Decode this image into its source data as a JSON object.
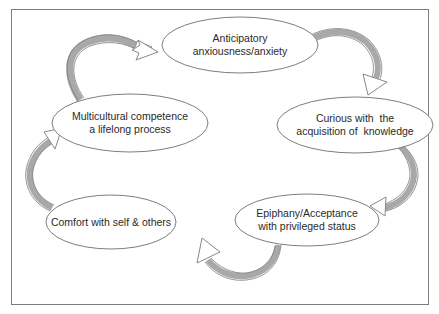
{
  "diagram": {
    "type": "cycle",
    "colors": {
      "frame_border": "#7d7d7d",
      "ellipse_stroke": "#6e6e6e",
      "arrow_stroke": "#7a7a7a",
      "arrow_shade": "#a8a8a8",
      "text": "#2a2a2a"
    },
    "nodes": [
      {
        "id": "anticipatory",
        "lines": [
          "Anticipatory",
          "anxiousness/anxiety"
        ]
      },
      {
        "id": "curious",
        "lines": [
          "Curious with  the",
          "acquisition of  knowledge"
        ]
      },
      {
        "id": "epiphany",
        "lines": [
          "Epiphany/Acceptance",
          "with privileged status"
        ]
      },
      {
        "id": "comfort",
        "lines": [
          "Comfort with self & others"
        ]
      },
      {
        "id": "multicultural",
        "lines": [
          "Multicultural competence",
          "a lifelong process"
        ]
      }
    ],
    "edges": [
      {
        "from": "multicultural",
        "to": "anticipatory"
      },
      {
        "from": "anticipatory",
        "to": "curious"
      },
      {
        "from": "curious",
        "to": "epiphany"
      },
      {
        "from": "epiphany",
        "to": "comfort"
      },
      {
        "from": "comfort",
        "to": "multicultural"
      }
    ]
  }
}
